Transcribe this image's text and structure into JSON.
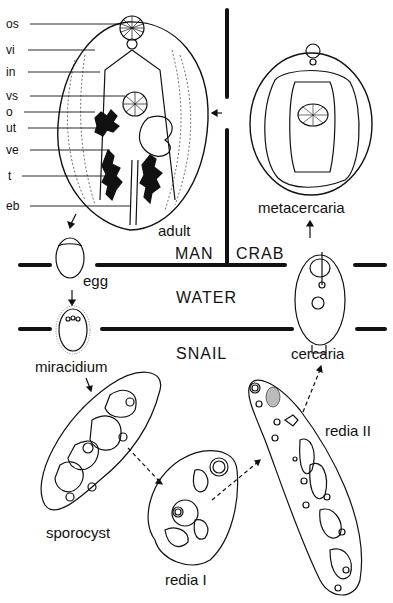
{
  "diagram": {
    "title": "",
    "part_labels": [
      {
        "key": "os",
        "text": "os"
      },
      {
        "key": "vi",
        "text": "vi"
      },
      {
        "key": "in",
        "text": "in"
      },
      {
        "key": "vs",
        "text": "vs"
      },
      {
        "key": "o",
        "text": "o"
      },
      {
        "key": "ut",
        "text": "ut"
      },
      {
        "key": "ve",
        "text": "ve"
      },
      {
        "key": "t",
        "text": "t"
      },
      {
        "key": "eb",
        "text": "eb"
      }
    ],
    "stages": {
      "adult": "adult",
      "metacercaria": "metacercaria",
      "egg": "egg",
      "miracidium": "miracidium",
      "sporocyst": "sporocyst",
      "redia1": "redia I",
      "redia2": "redia II",
      "cercaria": "cercaria"
    },
    "hosts": {
      "man": "MAN",
      "crab": "CRAB",
      "water": "WATER",
      "snail": "SNAIL"
    },
    "flow": [
      "adult",
      "egg",
      "miracidium",
      "sporocyst",
      "redia I",
      "redia II",
      "cercaria",
      "metacercaria",
      "adult"
    ]
  }
}
